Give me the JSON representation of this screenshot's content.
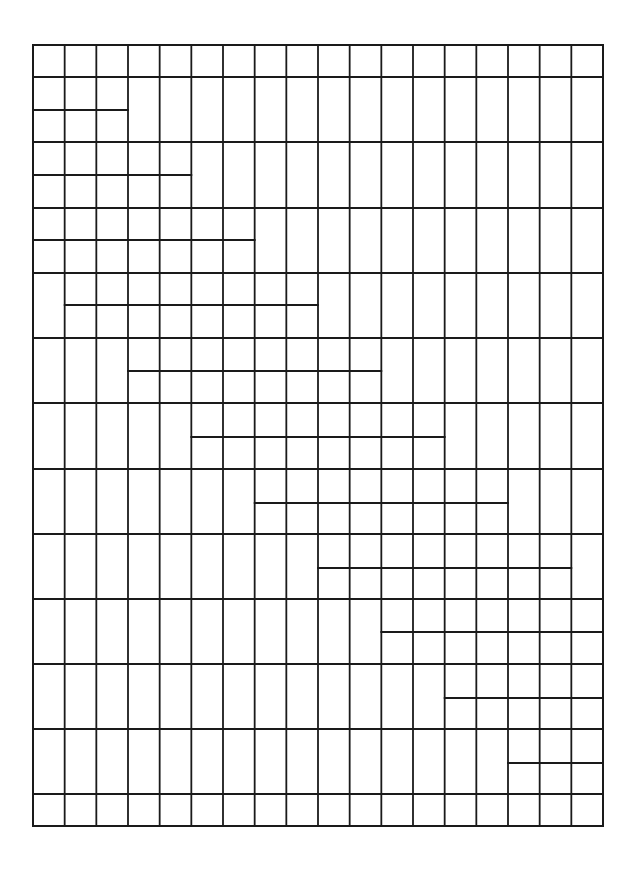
{
  "diagram": {
    "title": "",
    "type": "staggered-grid",
    "stroke_color": "#1a1a1a",
    "background": "#ffffff",
    "frame": {
      "x": 33,
      "y": 45,
      "width": 570,
      "height": 781
    },
    "columns": 18,
    "full_rows_y": [
      45,
      77,
      142,
      208,
      273,
      338,
      403,
      469,
      534,
      599,
      664,
      729,
      794,
      826
    ],
    "partial_lines": [
      {
        "y": 110,
        "col_start": 0,
        "col_end": 3
      },
      {
        "y": 175,
        "col_start": 0,
        "col_end": 5
      },
      {
        "y": 240,
        "col_start": 0,
        "col_end": 7
      },
      {
        "y": 305,
        "col_start": 1,
        "col_end": 9
      },
      {
        "y": 371,
        "col_start": 3,
        "col_end": 11
      },
      {
        "y": 437,
        "col_start": 5,
        "col_end": 13
      },
      {
        "y": 503,
        "col_start": 7,
        "col_end": 15
      },
      {
        "y": 568,
        "col_start": 9,
        "col_end": 17
      },
      {
        "y": 632,
        "col_start": 11,
        "col_end": 18
      },
      {
        "y": 698,
        "col_start": 13,
        "col_end": 18
      },
      {
        "y": 763,
        "col_start": 15,
        "col_end": 18
      }
    ]
  }
}
